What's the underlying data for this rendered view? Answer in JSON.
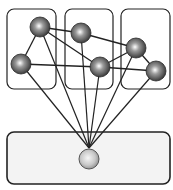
{
  "diagram": {
    "width": 173,
    "height": 190,
    "colors": {
      "stroke": "#222222",
      "top_box_fill": "#ffffff",
      "bottom_box_fill": "#f3f3f3",
      "node_dark": "#3a3a3a",
      "node_light": "#ffffff",
      "bottom_node_dark": "#8c8c8c",
      "bottom_node_light": "#f4f4f4"
    },
    "groups": [
      {
        "id": "group-1",
        "x": 7,
        "y": 9,
        "w": 49,
        "h": 80
      },
      {
        "id": "group-2",
        "x": 65,
        "y": 9,
        "w": 48,
        "h": 80
      },
      {
        "id": "group-3",
        "x": 121,
        "y": 9,
        "w": 49,
        "h": 80
      }
    ],
    "base": {
      "id": "base-container",
      "x": 7,
      "y": 132,
      "w": 163,
      "h": 52
    },
    "nodes": [
      {
        "id": "n1",
        "x": 40,
        "y": 27,
        "r": 10
      },
      {
        "id": "n2",
        "x": 21,
        "y": 64,
        "r": 10
      },
      {
        "id": "n3",
        "x": 81,
        "y": 33,
        "r": 10
      },
      {
        "id": "n4",
        "x": 100,
        "y": 67,
        "r": 10
      },
      {
        "id": "n5",
        "x": 136,
        "y": 48,
        "r": 10
      },
      {
        "id": "n6",
        "x": 156,
        "y": 71,
        "r": 10
      }
    ],
    "hub": {
      "id": "hub",
      "x": 89,
      "y": 159,
      "r": 10,
      "anchor_x": 89,
      "anchor_y": 148
    },
    "edges": [
      [
        "n1",
        "n2"
      ],
      [
        "n1",
        "n3"
      ],
      [
        "n1",
        "n4"
      ],
      [
        "n2",
        "n4"
      ],
      [
        "n3",
        "n5"
      ],
      [
        "n4",
        "n5"
      ],
      [
        "n4",
        "n6"
      ],
      [
        "n5",
        "n6"
      ]
    ],
    "hub_edges": [
      "n1",
      "n2",
      "n3",
      "n4",
      "n5",
      "n6"
    ]
  }
}
